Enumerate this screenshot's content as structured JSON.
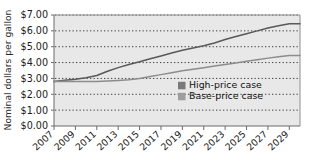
{
  "chart_data": {
    "type": "line",
    "title": "",
    "xlabel": "",
    "ylabel": "Nominal dollars per gallon",
    "x": [
      2007,
      2008,
      2009,
      2010,
      2011,
      2012,
      2013,
      2014,
      2015,
      2016,
      2017,
      2018,
      2019,
      2020,
      2021,
      2022,
      2023,
      2024,
      2025,
      2026,
      2027,
      2028,
      2029,
      2030
    ],
    "xlim": [
      2007,
      2030
    ],
    "ylim": [
      0.0,
      7.0
    ],
    "ytick_labels": [
      "$0.00",
      "$1.00",
      "$2.00",
      "$3.00",
      "$4.00",
      "$5.00",
      "$6.00",
      "$7.00"
    ],
    "ytick_values": [
      0.0,
      1.0,
      2.0,
      3.0,
      4.0,
      5.0,
      6.0,
      7.0
    ],
    "xtick_labels": [
      "2007",
      "2009",
      "2011",
      "2013",
      "2015",
      "2017",
      "2019",
      "2021",
      "2023",
      "2025",
      "2027",
      "2029"
    ],
    "xtick_values": [
      2007,
      2009,
      2011,
      2013,
      2015,
      2017,
      2019,
      2021,
      2023,
      2025,
      2027,
      2029
    ],
    "grid": "horizontal-dotted",
    "legend_position": "inside-center-right",
    "plot_background": "#e8e8e8",
    "series": [
      {
        "name": "High-price case",
        "color": "#595959",
        "swatch_color": "#7a7a7a",
        "values": [
          2.8,
          2.88,
          2.95,
          3.05,
          3.18,
          3.45,
          3.68,
          3.88,
          4.05,
          4.24,
          4.42,
          4.6,
          4.78,
          4.92,
          5.06,
          5.24,
          5.45,
          5.64,
          5.82,
          6.0,
          6.18,
          6.32,
          6.45,
          6.45
        ]
      },
      {
        "name": "Base-price case",
        "color": "#8c8c8c",
        "swatch_color": "#9e9e9e",
        "values": [
          2.8,
          2.82,
          2.81,
          2.8,
          2.8,
          2.83,
          2.87,
          2.92,
          3.0,
          3.12,
          3.24,
          3.36,
          3.48,
          3.58,
          3.68,
          3.78,
          3.88,
          3.98,
          4.08,
          4.18,
          4.28,
          4.37,
          4.45,
          4.45
        ]
      }
    ]
  },
  "legend": {
    "entries": [
      {
        "label": "High-price case"
      },
      {
        "label": "Base-price case"
      }
    ]
  },
  "axis": {
    "y_title": "Nominal dollars per gallon"
  }
}
